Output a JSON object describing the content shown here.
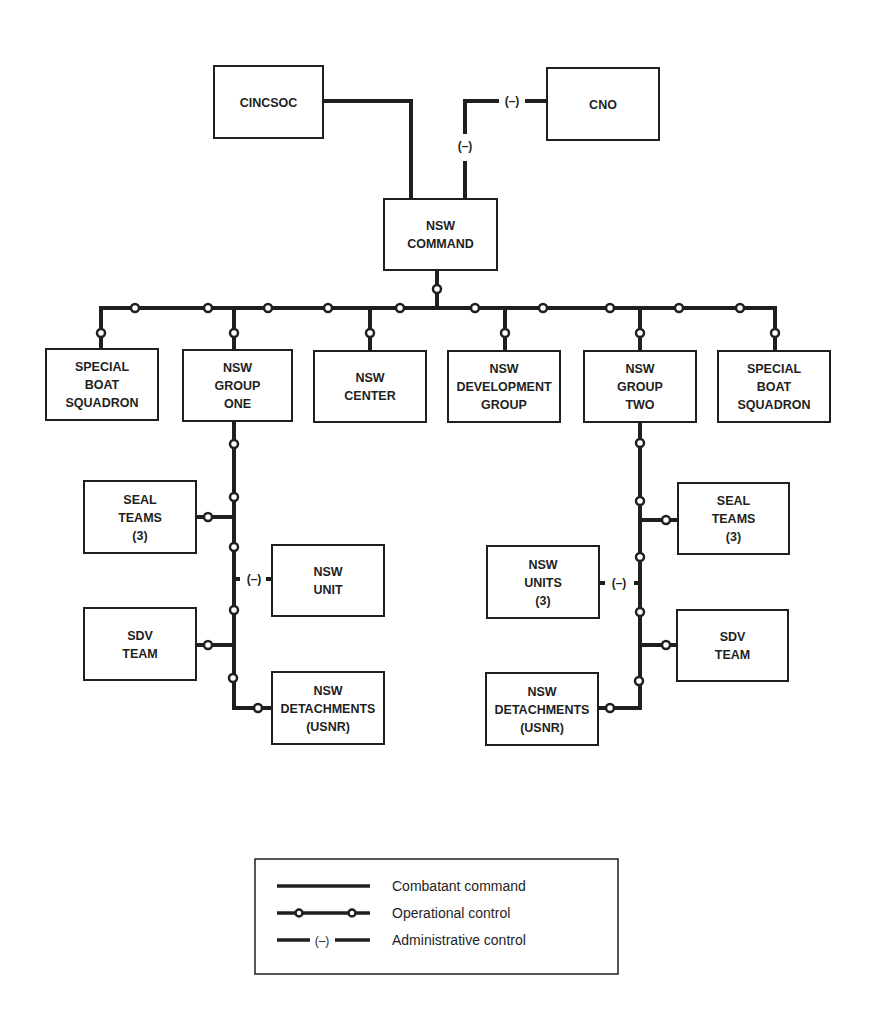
{
  "diagram": {
    "type": "org-chart",
    "nodes": {
      "cincsoc": [
        "CINCSOC"
      ],
      "cno": [
        "CNO"
      ],
      "nsw_command": [
        "NSW",
        "COMMAND"
      ],
      "sbs_left": [
        "SPECIAL",
        "BOAT",
        "SQUADRON"
      ],
      "nsw_group_one": [
        "NSW",
        "GROUP",
        "ONE"
      ],
      "nsw_center": [
        "NSW",
        "CENTER"
      ],
      "nsw_dev_group": [
        "NSW",
        "DEVELOPMENT",
        "GROUP"
      ],
      "nsw_group_two": [
        "NSW",
        "GROUP",
        "TWO"
      ],
      "sbs_right": [
        "SPECIAL",
        "BOAT",
        "SQUADRON"
      ],
      "seal_teams_1": [
        "SEAL",
        "TEAMS",
        "(3)"
      ],
      "nsw_unit_1": [
        "NSW",
        "UNIT"
      ],
      "sdv_team_1": [
        "SDV",
        "TEAM"
      ],
      "nsw_det_1": [
        "NSW",
        "DETACHMENTS",
        "(USNR)"
      ],
      "seal_teams_2": [
        "SEAL",
        "TEAMS",
        "(3)"
      ],
      "nsw_units_2": [
        "NSW",
        "UNITS",
        "(3)"
      ],
      "sdv_team_2": [
        "SDV",
        "TEAM"
      ],
      "nsw_det_2": [
        "NSW",
        "DETACHMENTS",
        "(USNR)"
      ]
    },
    "relationships": [
      {
        "from": "cincsoc",
        "to": "nsw_command",
        "type": "combatant_command"
      },
      {
        "from": "cno",
        "to": "nsw_command",
        "type": "administrative_control"
      },
      {
        "from": "nsw_command",
        "to": "sbs_left",
        "type": "operational_control"
      },
      {
        "from": "nsw_command",
        "to": "nsw_group_one",
        "type": "operational_control"
      },
      {
        "from": "nsw_command",
        "to": "nsw_center",
        "type": "operational_control"
      },
      {
        "from": "nsw_command",
        "to": "nsw_dev_group",
        "type": "operational_control"
      },
      {
        "from": "nsw_command",
        "to": "nsw_group_two",
        "type": "operational_control"
      },
      {
        "from": "nsw_command",
        "to": "sbs_right",
        "type": "operational_control"
      },
      {
        "from": "nsw_group_one",
        "to": "seal_teams_1",
        "type": "operational_control"
      },
      {
        "from": "nsw_group_one",
        "to": "nsw_unit_1",
        "type": "administrative_control"
      },
      {
        "from": "nsw_group_one",
        "to": "sdv_team_1",
        "type": "operational_control"
      },
      {
        "from": "nsw_group_one",
        "to": "nsw_det_1",
        "type": "operational_control"
      },
      {
        "from": "nsw_group_two",
        "to": "seal_teams_2",
        "type": "operational_control"
      },
      {
        "from": "nsw_group_two",
        "to": "nsw_units_2",
        "type": "administrative_control"
      },
      {
        "from": "nsw_group_two",
        "to": "sdv_team_2",
        "type": "operational_control"
      },
      {
        "from": "nsw_group_two",
        "to": "nsw_det_2",
        "type": "operational_control"
      }
    ],
    "admin_marker": "(–)"
  },
  "legend": {
    "combatant_command": "Combatant command",
    "operational_control": "Operational control",
    "administrative_control": "Administrative control",
    "admin_marker": "(–)"
  }
}
